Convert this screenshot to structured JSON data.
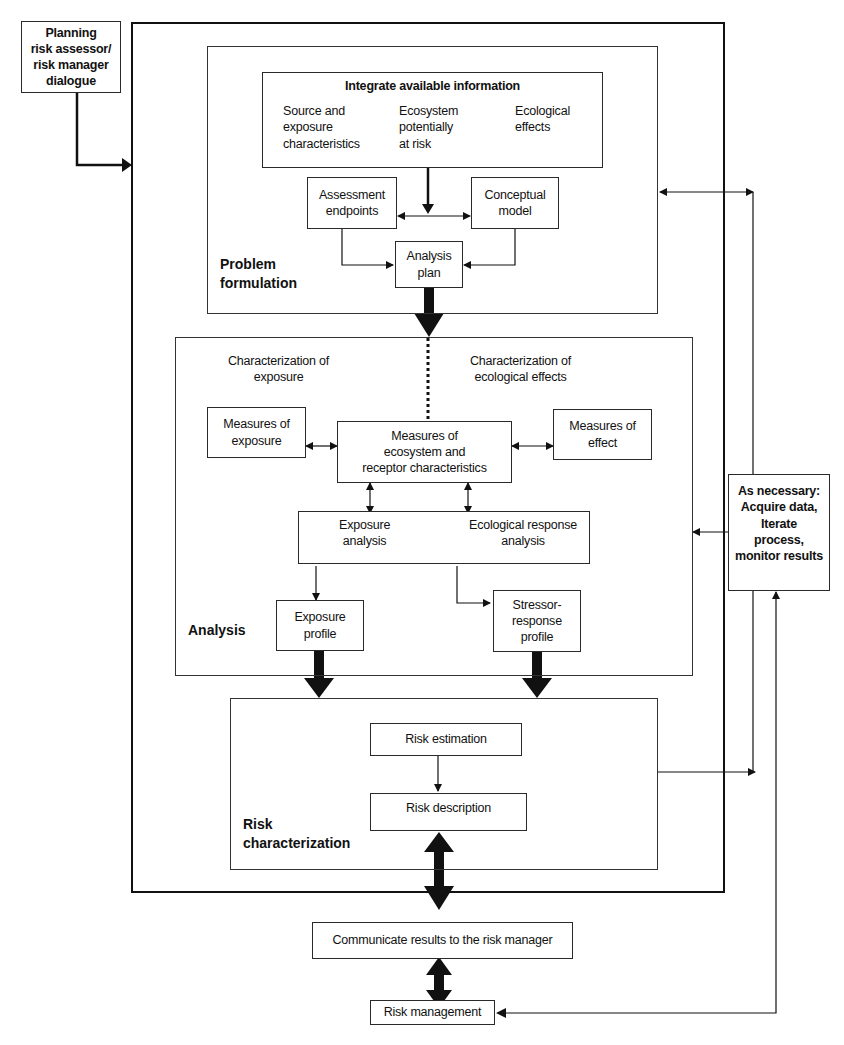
{
  "diagram": {
    "planning": "Planning\nrisk assessor/\nrisk manager\ndialogue",
    "problem_formulation": {
      "title": "Problem\nformulation",
      "integrate": {
        "title": "Integrate available information",
        "col1": "Source and\nexposure\ncharacteristics",
        "col2": "Ecosystem\npotentially\nat risk",
        "col3": "Ecological\neffects"
      },
      "assessment_endpoints": "Assessment\nendpoints",
      "conceptual_model": "Conceptual\nmodel",
      "analysis_plan": "Analysis\nplan"
    },
    "analysis": {
      "title": "Analysis",
      "char_exposure": "Characterization of\nexposure",
      "char_effects": "Characterization of\necological effects",
      "measures_exposure": "Measures of\nexposure",
      "measures_ecosystem": "Measures of\necosystem and\nreceptor characteristics",
      "measures_effect": "Measures of\neffect",
      "exposure_analysis": "Exposure\nanalysis",
      "ecological_response_analysis": "Ecological response\nanalysis",
      "exposure_profile": "Exposure\nprofile",
      "stressor_response_profile": "Stressor-\nresponse\nprofile"
    },
    "risk_characterization": {
      "title": "Risk\ncharacterization",
      "risk_estimation": "Risk estimation",
      "risk_description": "Risk description"
    },
    "as_necessary": "As necessary:\nAcquire data,\nIterate\nprocess,\nmonitor results",
    "communicate": "Communicate results to the risk manager",
    "risk_management": "Risk management"
  }
}
